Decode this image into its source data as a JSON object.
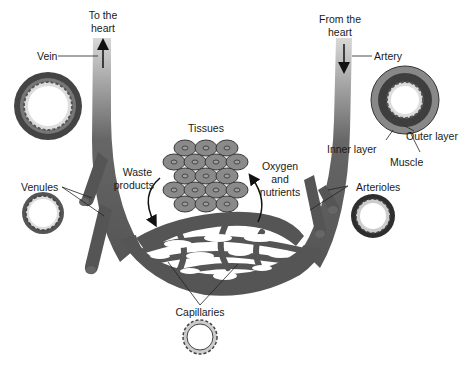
{
  "diagram": {
    "labels": {
      "to_heart_1": "To the",
      "to_heart_2": "heart",
      "from_heart_1": "From the",
      "from_heart_2": "heart",
      "vein": "Vein",
      "artery": "Artery",
      "outer_layer": "Outer layer",
      "inner_layer": "Inner layer",
      "muscle": "Muscle",
      "tissues": "Tissues",
      "waste_1": "Waste",
      "waste_2": "products",
      "oxygen_1": "Oxygen",
      "oxygen_2": "and",
      "oxygen_3": "nutrients",
      "venules": "Venules",
      "arterioles": "Arterioles",
      "capillaries": "Capillaries"
    },
    "colors": {
      "vessel": "#555555",
      "vessel_light": "#bdbdbd",
      "cell": "#8a8a8a",
      "cell_outline": "#3a3a3a",
      "text": "#1a1a1a"
    }
  }
}
